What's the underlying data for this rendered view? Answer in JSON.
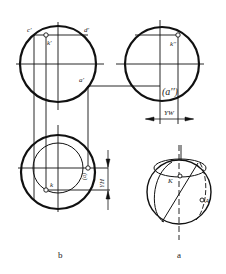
{
  "figure": {
    "panel_b": {
      "caption": "b",
      "front_view_labels": {
        "c": "c'",
        "d": "d'",
        "k": "k'",
        "a": "a'"
      },
      "side_view_labels": {
        "k": "k''",
        "a": "(a'')"
      },
      "top_view_labels": {
        "k": "k",
        "a": "(a)"
      },
      "dimension_yw": "YW",
      "dimension_yh": "YH"
    },
    "panel_a": {
      "caption": "a",
      "labels": {
        "k": "K",
        "a": "A"
      }
    },
    "colors": {
      "line": "#111111",
      "background": "#ffffff"
    }
  }
}
